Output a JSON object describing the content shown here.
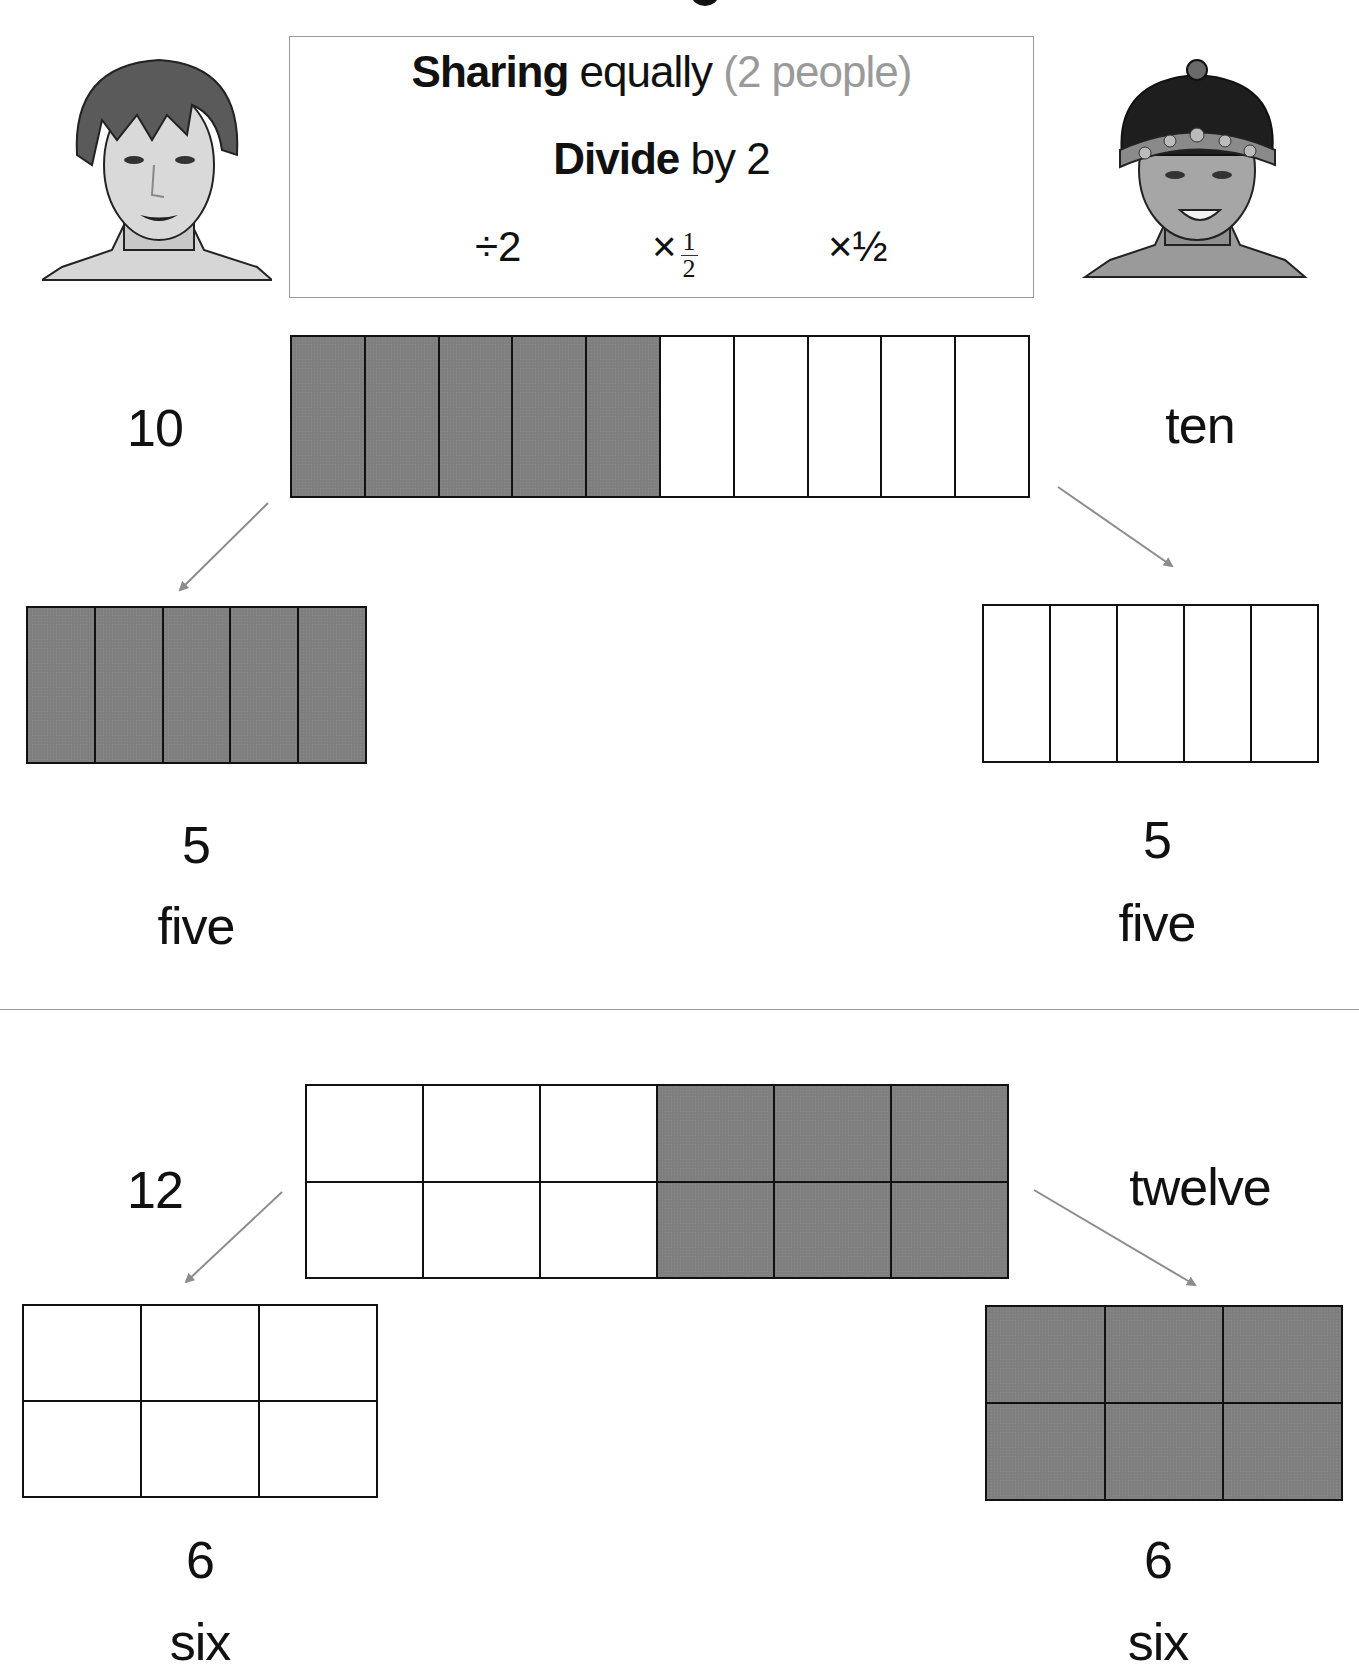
{
  "header": {
    "line1": {
      "bold": "Sharing",
      "normal": " equally ",
      "muted": "(2 people)"
    },
    "line2": {
      "bold": "Divide",
      "normal": " by 2"
    },
    "operations": {
      "divide": "÷2",
      "times_fraction_sign": "×",
      "fraction_numerator": "1",
      "fraction_denominator": "2",
      "times_half": "×½"
    }
  },
  "characters": [
    {
      "name": "person-left",
      "description": "short-haired child portrait"
    },
    {
      "name": "person-right",
      "description": "child wearing beaded headband and cap"
    }
  ],
  "example_1": {
    "total_numeral": "10",
    "total_word": "ten",
    "bar": {
      "cols": 10,
      "rows": 1,
      "shaded": [
        true,
        true,
        true,
        true,
        true,
        false,
        false,
        false,
        false,
        false
      ]
    },
    "left_share": {
      "numeral": "5",
      "word": "five",
      "cols": 5,
      "rows": 1,
      "shaded": true
    },
    "right_share": {
      "numeral": "5",
      "word": "five",
      "cols": 5,
      "rows": 1,
      "shaded": false
    }
  },
  "example_2": {
    "total_numeral": "12",
    "total_word": "twelve",
    "grid": {
      "cols": 6,
      "rows": 2,
      "shaded_cols": [
        false,
        false,
        false,
        true,
        true,
        true
      ]
    },
    "left_share": {
      "numeral": "6",
      "word": "six",
      "cols": 3,
      "rows": 2,
      "shaded": false
    },
    "right_share": {
      "numeral": "6",
      "word": "six",
      "cols": 3,
      "rows": 2,
      "shaded": true
    }
  },
  "colors": {
    "shaded": "#7f7f7f",
    "line": "#111111",
    "arrow": "#8c8c8c",
    "muted_text": "#9a9a9a",
    "border": "#9a9a9a"
  }
}
